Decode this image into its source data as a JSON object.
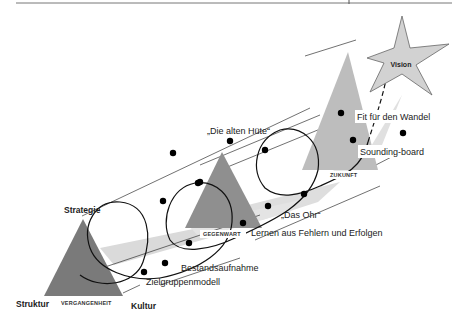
{
  "diagram": {
    "corners": {
      "top": "Strategie",
      "left": "Struktur",
      "right": "Kultur"
    },
    "phases": [
      {
        "label": "VERGANGENHEIT"
      },
      {
        "label": "GEGENWART"
      },
      {
        "label": "ZUKUNFT"
      }
    ],
    "goal": {
      "label": "Vision",
      "icon": "star-icon"
    },
    "annotations": [
      {
        "label": "„Die alten Hüte“"
      },
      {
        "label": "Fit für den Wandel"
      },
      {
        "label": "Sounding-board"
      },
      {
        "label": "„Das Ohr“"
      },
      {
        "label": "Lernen aus Fehlern und Erfolgen"
      },
      {
        "label": "Bestandsaufnahme"
      },
      {
        "label": "Zielgruppenmodell"
      }
    ],
    "colors": {
      "triangle_dark": "#7a7a7a",
      "triangle_mid": "#9a9a9a",
      "triangle_light": "#c4c4c4",
      "band": "#dcdcdc",
      "star_fill": "#d2d2d2",
      "line": "#111111"
    }
  }
}
